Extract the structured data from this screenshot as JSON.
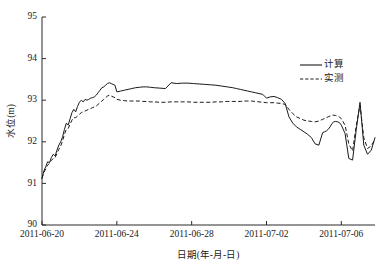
{
  "chart_data": {
    "type": "line",
    "title": "",
    "xlabel": "日期(年-月-日)",
    "ylabel": "水位(m)",
    "ylim": [
      90,
      95
    ],
    "ytick_labels": [
      "90",
      "91",
      "92",
      "93",
      "94",
      "95"
    ],
    "ytick_values": [
      90,
      91,
      92,
      93,
      94,
      95
    ],
    "xlim": [
      "2011-06-20",
      "2011-07-07.8"
    ],
    "xtick_labels": [
      "2011-06-20",
      "2011-06-24",
      "2011-06-28",
      "2011-07-02",
      "2011-07-06"
    ],
    "xtick_days": [
      0,
      4,
      8,
      12,
      16
    ],
    "grid": false,
    "legend_position": "upper-right",
    "legend": [
      {
        "name": "计算",
        "style": "solid",
        "color": "#1a1a1a"
      },
      {
        "name": "实测",
        "style": "dashed",
        "color": "#1a1a1a"
      }
    ],
    "x_days": [
      0,
      0.1,
      0.2,
      0.3,
      0.4,
      0.5,
      0.6,
      0.7,
      0.8,
      0.9,
      1.0,
      1.1,
      1.2,
      1.3,
      1.4,
      1.5,
      1.6,
      1.7,
      1.8,
      1.9,
      2.0,
      2.1,
      2.2,
      2.3,
      2.4,
      2.5,
      2.6,
      2.7,
      2.8,
      2.9,
      3.0,
      3.1,
      3.2,
      3.3,
      3.4,
      3.5,
      3.6,
      3.7,
      3.8,
      3.9,
      4.0,
      4.2,
      4.4,
      4.6,
      4.8,
      5.0,
      5.2,
      5.4,
      5.6,
      5.8,
      6.0,
      6.3,
      6.6,
      6.9,
      7.2,
      7.5,
      7.8,
      8.1,
      8.4,
      8.7,
      9.0,
      9.3,
      9.6,
      9.9,
      10.2,
      10.4,
      10.6,
      10.8,
      11.0,
      11.2,
      11.4,
      11.6,
      11.8,
      12.0,
      12.2,
      12.4,
      12.6,
      12.8,
      13.0,
      13.2,
      13.4,
      13.6,
      13.8,
      14.0,
      14.2,
      14.4,
      14.6,
      14.8,
      15.0,
      15.1,
      15.2,
      15.3,
      15.4,
      15.5,
      15.6,
      15.7,
      15.8,
      15.9,
      16.0,
      16.2,
      16.4,
      16.6,
      16.8,
      17.0,
      17.2,
      17.4,
      17.6,
      17.8
    ],
    "series": [
      {
        "name": "计算",
        "style": "solid",
        "values": [
          91.12,
          91.3,
          91.4,
          91.52,
          91.5,
          91.62,
          91.7,
          91.66,
          91.8,
          91.92,
          92.0,
          92.12,
          92.3,
          92.45,
          92.4,
          92.55,
          92.7,
          92.78,
          92.72,
          92.85,
          92.95,
          93.0,
          92.96,
          93.02,
          93.0,
          93.02,
          93.05,
          93.06,
          93.08,
          93.12,
          93.18,
          93.24,
          93.3,
          93.32,
          93.36,
          93.4,
          93.42,
          93.4,
          93.38,
          93.36,
          93.2,
          93.22,
          93.24,
          93.26,
          93.28,
          93.3,
          93.31,
          93.32,
          93.32,
          93.31,
          93.3,
          93.29,
          93.28,
          93.42,
          93.4,
          93.41,
          93.41,
          93.4,
          93.39,
          93.38,
          93.37,
          93.36,
          93.34,
          93.32,
          93.3,
          93.28,
          93.26,
          93.24,
          93.22,
          93.2,
          93.18,
          93.16,
          93.14,
          93.05,
          93.08,
          93.09,
          93.06,
          93.02,
          92.92,
          92.6,
          92.45,
          92.36,
          92.3,
          92.24,
          92.18,
          92.1,
          91.95,
          91.92,
          92.22,
          92.24,
          92.26,
          92.3,
          92.36,
          92.44,
          92.48,
          92.49,
          92.48,
          92.46,
          92.4,
          92.2,
          91.6,
          91.56,
          92.3,
          92.95,
          91.92,
          91.7,
          91.8,
          92.1
        ]
      },
      {
        "name": "实测",
        "style": "dashed",
        "values": [
          91.12,
          91.26,
          91.35,
          91.44,
          91.48,
          91.55,
          91.6,
          91.62,
          91.72,
          91.82,
          91.9,
          92.02,
          92.18,
          92.3,
          92.32,
          92.42,
          92.52,
          92.58,
          92.58,
          92.62,
          92.66,
          92.7,
          92.72,
          92.74,
          92.76,
          92.78,
          92.8,
          92.82,
          92.84,
          92.86,
          92.9,
          92.94,
          92.98,
          93.02,
          93.06,
          93.1,
          93.12,
          93.1,
          93.08,
          93.06,
          93.02,
          93.0,
          92.99,
          92.98,
          92.98,
          92.98,
          92.98,
          92.97,
          92.97,
          92.96,
          92.96,
          92.95,
          92.95,
          92.96,
          92.96,
          92.96,
          92.96,
          92.95,
          92.95,
          92.95,
          92.95,
          92.96,
          92.96,
          92.97,
          92.97,
          92.97,
          92.97,
          92.98,
          92.98,
          92.98,
          92.97,
          92.96,
          92.95,
          92.94,
          92.94,
          92.94,
          92.93,
          92.92,
          92.9,
          92.78,
          92.68,
          92.6,
          92.56,
          92.52,
          92.5,
          92.49,
          92.48,
          92.5,
          92.54,
          92.56,
          92.58,
          92.6,
          92.62,
          92.64,
          92.64,
          92.63,
          92.62,
          92.6,
          92.55,
          92.4,
          91.95,
          91.78,
          92.4,
          92.88,
          92.1,
          91.84,
          91.9,
          92.06
        ]
      }
    ]
  },
  "axes": {
    "y_axis_label": "水位(m)",
    "x_axis_label": "日期(年-月-日)"
  }
}
